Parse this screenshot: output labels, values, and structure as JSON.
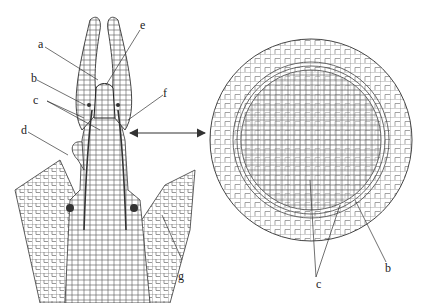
{
  "figure": {
    "left_panel": {
      "description": "Longitudinal section of shoot apex",
      "labels": [
        "a",
        "b",
        "c",
        "d",
        "e",
        "f",
        "g"
      ]
    },
    "right_panel": {
      "description": "Cross section of stem",
      "labels": [
        "b",
        "c"
      ]
    },
    "connector": "double-headed-arrow"
  },
  "labels": {
    "a": "a",
    "b": "b",
    "c": "c",
    "d": "d",
    "e": "e",
    "f": "f",
    "g": "g",
    "b2": "b",
    "c2": "c"
  }
}
